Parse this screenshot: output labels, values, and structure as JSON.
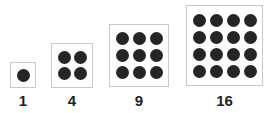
{
  "colors": {
    "dot": "#252525",
    "box_border": "#c8c8c8",
    "label": "#222222"
  },
  "figures": [
    {
      "label": "1",
      "rows": 1,
      "cols": 1,
      "box": {
        "left": 10,
        "top": 62,
        "width": 26,
        "height": 26
      },
      "gap": 0
    },
    {
      "label": "4",
      "rows": 2,
      "cols": 2,
      "box": {
        "left": 51,
        "top": 43,
        "width": 42,
        "height": 45
      },
      "gap": 3
    },
    {
      "label": "9",
      "rows": 3,
      "cols": 3,
      "box": {
        "left": 109,
        "top": 24,
        "width": 60,
        "height": 63
      },
      "gap": 4
    },
    {
      "label": "16",
      "rows": 4,
      "cols": 4,
      "box": {
        "left": 186,
        "top": 5,
        "width": 77,
        "height": 81
      },
      "gap": 4
    }
  ]
}
